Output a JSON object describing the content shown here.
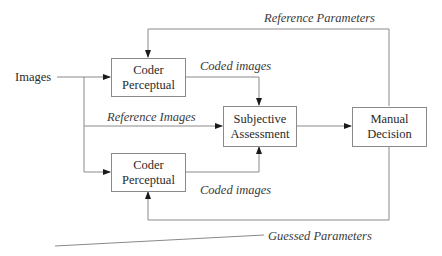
{
  "diagram": {
    "input_label": "Images",
    "nodes": {
      "coder_top": {
        "line1": "Coder",
        "line2": "Perceptual"
      },
      "coder_bottom": {
        "line1": "Coder",
        "line2": "Perceptual"
      },
      "subjective": {
        "line1": "Subjective",
        "line2": "Assessment"
      },
      "manual": {
        "line1": "Manual",
        "line2": "Decision"
      }
    },
    "edge_labels": {
      "reference_parameters": "Reference Parameters",
      "coded_images_top": "Coded images",
      "reference_images": "Reference Images",
      "coded_images_bottom": "Coded images",
      "guessed_parameters": "Guessed Parameters"
    },
    "colors": {
      "line": "#8a8a8a",
      "text": "#2a2a2a",
      "background": "#ffffff"
    }
  }
}
